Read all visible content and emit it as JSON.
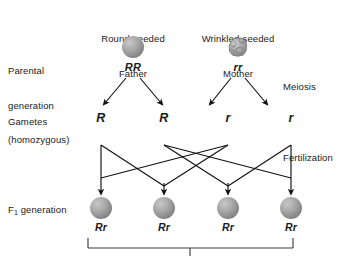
{
  "diagram": {
    "width": 350,
    "height": 256,
    "background": "#ffffff",
    "line_color": "#111111",
    "text_color": "#1a1a1a"
  },
  "row_labels": {
    "parental_line1": "Parental",
    "parental_line2": "generation",
    "parental_line3": "(homozygous)",
    "gametes": "Gametes",
    "f1_prefix": "F",
    "f1_subscript": "1",
    "f1_suffix": " generation"
  },
  "side_labels": {
    "meiosis": "Meiosis",
    "fertilization": "Fertilization"
  },
  "parents": [
    {
      "phenotype_line1": "Round-seeded",
      "phenotype_line2": "Father",
      "genotype": "RR",
      "seed_shape": "round",
      "x": 133
    },
    {
      "phenotype_line1": "Wrinkled-seeded",
      "phenotype_line2": "Mother",
      "genotype": "rr",
      "seed_shape": "wrinkled",
      "x": 238
    }
  ],
  "gametes": [
    {
      "allele": "R",
      "x": 101
    },
    {
      "allele": "R",
      "x": 164
    },
    {
      "allele": "r",
      "x": 228
    },
    {
      "allele": "r",
      "x": 291
    }
  ],
  "f1_offspring": [
    {
      "genotype": "Rr",
      "x": 101,
      "seed_shape": "round"
    },
    {
      "genotype": "Rr",
      "x": 164,
      "seed_shape": "round"
    },
    {
      "genotype": "Rr",
      "x": 228,
      "seed_shape": "round"
    },
    {
      "genotype": "Rr",
      "x": 291,
      "seed_shape": "round"
    }
  ],
  "colors": {
    "seed_fill_light": "#c8c8c8",
    "seed_fill_mid": "#9a9a9a",
    "seed_fill_dark": "#6e6e6e",
    "stroke": "#111111"
  }
}
